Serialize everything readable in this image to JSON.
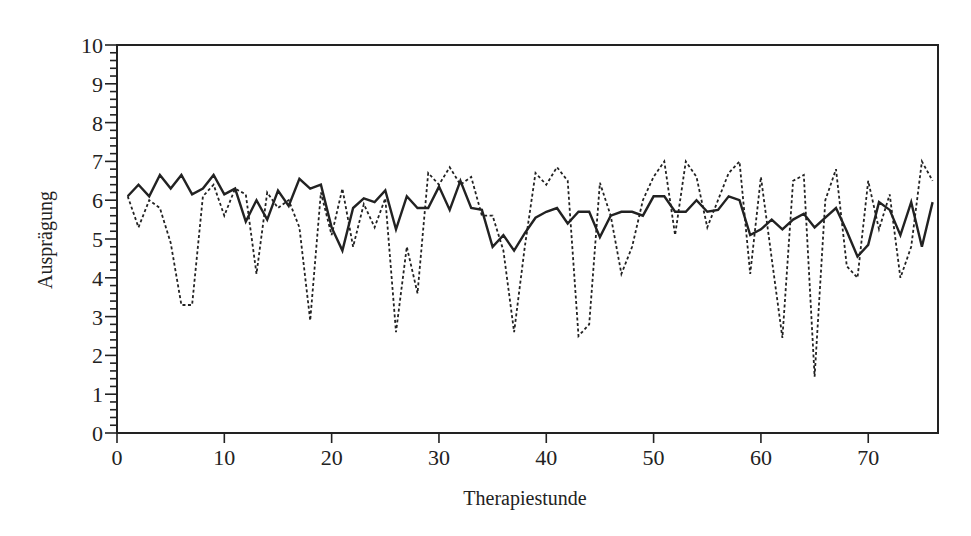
{
  "chart_data": {
    "type": "line",
    "title": "",
    "xlabel": "Therapiestunde",
    "ylabel": "Ausprägung",
    "xlim": [
      0,
      76.5
    ],
    "ylim": [
      0,
      10
    ],
    "xticks": [
      0,
      10,
      20,
      30,
      40,
      50,
      60,
      70
    ],
    "yticks": [
      0,
      1,
      2,
      3,
      4,
      5,
      6,
      7,
      8,
      9,
      10
    ],
    "grid": false,
    "legend": null,
    "x": [
      1,
      2,
      3,
      4,
      5,
      6,
      7,
      8,
      9,
      10,
      11,
      12,
      13,
      14,
      15,
      16,
      17,
      18,
      19,
      20,
      21,
      22,
      23,
      24,
      25,
      26,
      27,
      28,
      29,
      30,
      31,
      32,
      33,
      34,
      35,
      36,
      37,
      38,
      39,
      40,
      41,
      42,
      43,
      44,
      45,
      46,
      47,
      48,
      49,
      50,
      51,
      52,
      53,
      54,
      55,
      56,
      57,
      58,
      59,
      60,
      61,
      62,
      63,
      64,
      65,
      66,
      67,
      68,
      69,
      70,
      71,
      72,
      73,
      74,
      75,
      76
    ],
    "series": [
      {
        "name": "solid",
        "style": "solid",
        "color": "#222222",
        "values": [
          6.1,
          6.4,
          6.1,
          6.65,
          6.3,
          6.65,
          6.15,
          6.3,
          6.65,
          6.15,
          6.3,
          5.45,
          6.0,
          5.5,
          6.25,
          5.85,
          6.55,
          6.3,
          6.4,
          5.3,
          4.7,
          5.8,
          6.05,
          5.95,
          6.25,
          5.25,
          6.1,
          5.8,
          5.8,
          6.35,
          5.75,
          6.5,
          5.8,
          5.75,
          4.8,
          5.1,
          4.7,
          5.15,
          5.55,
          5.7,
          5.8,
          5.4,
          5.7,
          5.7,
          5.05,
          5.6,
          5.7,
          5.7,
          5.6,
          6.1,
          6.1,
          5.7,
          5.7,
          6.0,
          5.7,
          5.75,
          6.1,
          6.0,
          5.1,
          5.25,
          5.5,
          5.25,
          5.5,
          5.65,
          5.3,
          5.55,
          5.8,
          5.2,
          4.55,
          4.85,
          5.95,
          5.75,
          5.1,
          5.95,
          4.8,
          5.95
        ]
      },
      {
        "name": "dashed",
        "style": "dashed",
        "color": "#222222",
        "values": [
          6.1,
          5.3,
          6.0,
          5.8,
          4.9,
          3.3,
          3.3,
          6.1,
          6.4,
          5.6,
          6.3,
          6.15,
          4.1,
          6.2,
          5.8,
          6.0,
          5.3,
          2.9,
          6.2,
          5.1,
          6.3,
          4.8,
          5.9,
          5.3,
          6.05,
          2.6,
          4.8,
          3.6,
          6.7,
          6.4,
          6.85,
          6.4,
          6.6,
          5.6,
          5.6,
          4.7,
          2.6,
          4.8,
          6.7,
          6.4,
          6.85,
          6.5,
          2.5,
          2.8,
          6.45,
          5.6,
          4.1,
          4.8,
          6.0,
          6.6,
          7.0,
          5.1,
          7.0,
          6.6,
          5.3,
          6.0,
          6.7,
          7.0,
          4.1,
          6.6,
          4.5,
          2.45,
          6.5,
          6.65,
          1.45,
          6.0,
          6.8,
          4.3,
          4.0,
          6.5,
          5.25,
          6.15,
          4.0,
          4.8,
          7.0,
          6.5
        ]
      }
    ]
  },
  "axes": {
    "x_title": "Therapiestunde",
    "y_title": "Ausprägung",
    "x_tick_labels": [
      "0",
      "10",
      "20",
      "30",
      "40",
      "50",
      "60",
      "70"
    ],
    "y_tick_labels": [
      "0",
      "1",
      "2",
      "3",
      "4",
      "5",
      "6",
      "7",
      "8",
      "9",
      "10"
    ]
  }
}
